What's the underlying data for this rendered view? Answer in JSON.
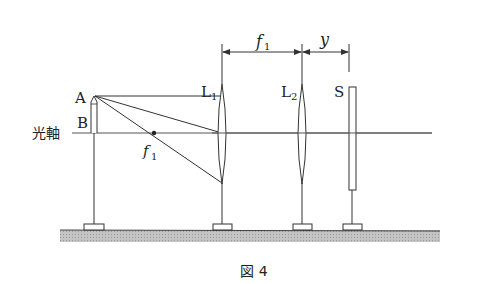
{
  "figure": {
    "caption": "図 4",
    "labels": {
      "point_a": "A",
      "point_b": "B",
      "optical_axis": "光軸",
      "focal_point": "f",
      "focal_sub": "1",
      "lens1": "L",
      "lens1_sub": "1",
      "lens2": "L",
      "lens2_sub": "2",
      "screen": "S",
      "dim_f": "f",
      "dim_f_sub": "1",
      "dim_y": "y"
    },
    "colors": {
      "line": "#333333",
      "ground": "#b8b8b8"
    }
  }
}
